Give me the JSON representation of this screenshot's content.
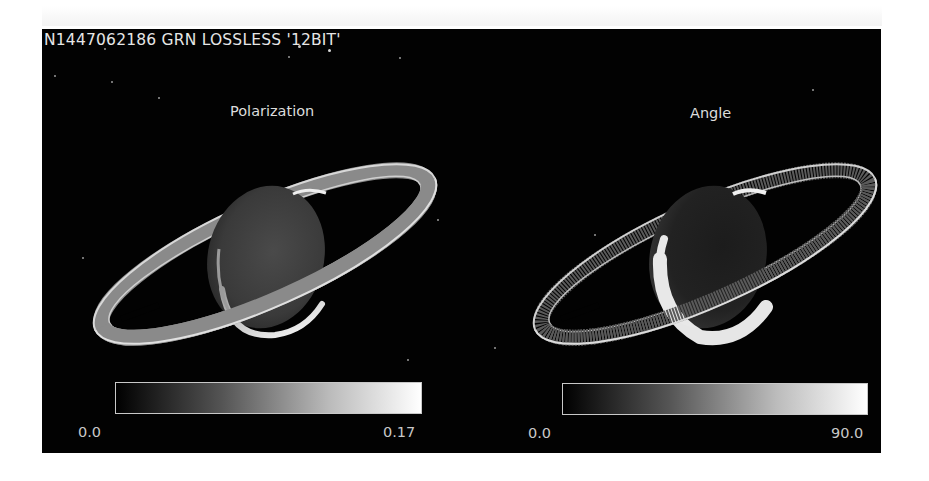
{
  "image": {
    "header": "N1447062186 GRN LOSSLESS '12BIT'",
    "panels": [
      {
        "title": "Polarization",
        "colorbar": {
          "min_label": "0.0",
          "max_label": "0.17",
          "colormap": "grayscale"
        },
        "subject": "saturn-polarization-map"
      },
      {
        "title": "Angle",
        "colorbar": {
          "min_label": "0.0",
          "max_label": "90.0",
          "colormap": "grayscale"
        },
        "subject": "saturn-angle-map"
      }
    ],
    "colors": {
      "background": "#020202",
      "text": "#dcdcdc",
      "page": "#ffffff"
    }
  }
}
